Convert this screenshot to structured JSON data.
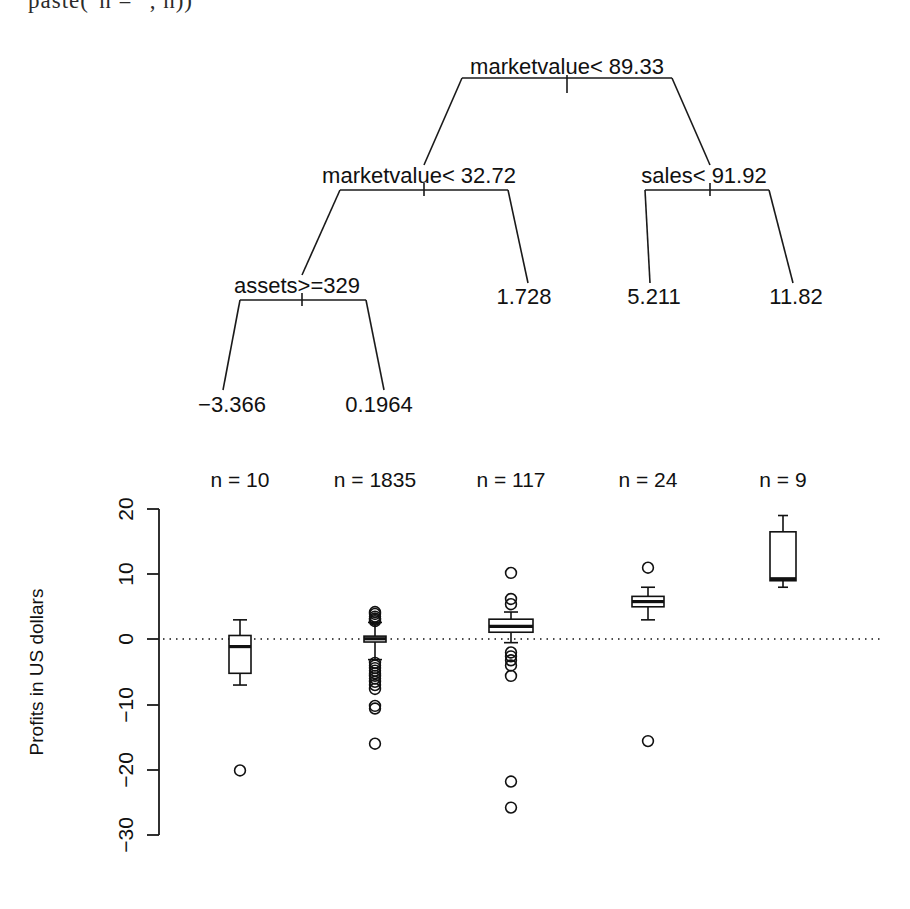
{
  "code_fragment": "paste(\"n = \", n))",
  "tree": {
    "nodes": [
      {
        "id": "root",
        "label": "marketvalue< 89.33",
        "x": 567,
        "y": 66
      },
      {
        "id": "n2",
        "label": "marketvalue< 32.72",
        "x": 419,
        "y": 175
      },
      {
        "id": "n3",
        "label": "sales< 91.92",
        "x": 704,
        "y": 175
      },
      {
        "id": "n4",
        "label": "assets>=329",
        "x": 297,
        "y": 285
      }
    ],
    "leaves": [
      {
        "id": "l1",
        "label": "−3.366",
        "x": 232,
        "y": 404
      },
      {
        "id": "l2",
        "label": "0.1964",
        "x": 379,
        "y": 404
      },
      {
        "id": "l3",
        "label": "1.728",
        "x": 524,
        "y": 296
      },
      {
        "id": "l4",
        "label": "5.211",
        "x": 654,
        "y": 296
      },
      {
        "id": "l5",
        "label": "11.82",
        "x": 796,
        "y": 296
      }
    ]
  },
  "boxplot": {
    "ylabel": "Profits in US dollars",
    "y_ticks": [
      20,
      10,
      0,
      -10,
      -20,
      -30
    ],
    "y_tick_labels": [
      "20",
      "10",
      "0",
      "−10",
      "−20",
      "−30"
    ],
    "ylim": [
      -30,
      20
    ],
    "zero_reference_line": 0,
    "group_labels": [
      "n =  10",
      "n =  1835",
      "n =  117",
      "n =  24",
      "n =  9"
    ],
    "group_counts": [
      10,
      1835,
      117,
      24,
      9
    ]
  },
  "chart_data": {
    "type": "box",
    "title": "",
    "xlabel": "",
    "ylabel": "Profits in US dollars",
    "ylim": [
      -30,
      20
    ],
    "grid": false,
    "legend": "none",
    "categories": [
      "n =  10",
      "n =  1835",
      "n =  117",
      "n =  24",
      "n =  9"
    ],
    "reference_line": {
      "y": 0,
      "style": "dotted"
    },
    "series": [
      {
        "name": "n =  10",
        "n": 10,
        "whisker_low": -7.0,
        "q1": -5.2,
        "median": -1.1,
        "q3": 0.6,
        "whisker_high": 3.0,
        "outliers": [
          -20.1
        ]
      },
      {
        "name": "n =  1835",
        "n": 1835,
        "whisker_low": -3.1,
        "q1": -0.4,
        "median": 0.1,
        "q3": 0.5,
        "whisker_high": 2.6,
        "outliers": [
          4.2,
          3.9,
          3.5,
          3.2,
          3.0,
          2.8,
          -3.6,
          -4.0,
          -4.4,
          -4.8,
          -5.2,
          -5.6,
          -6.0,
          -6.5,
          -7.0,
          -7.6,
          -10.2,
          -10.6,
          -16.0
        ]
      },
      {
        "name": "n =  117",
        "n": 117,
        "whisker_low": -0.5,
        "q1": 1.1,
        "median": 2.0,
        "q3": 3.1,
        "whisker_high": 4.2,
        "outliers": [
          10.2,
          6.2,
          5.4,
          -2.0,
          -2.6,
          -3.2,
          -4.0,
          -5.6,
          -21.8,
          -25.8
        ]
      },
      {
        "name": "n =  24",
        "n": 24,
        "whisker_low": 3.0,
        "q1": 5.0,
        "median": 5.8,
        "q3": 6.6,
        "whisker_high": 8.0,
        "outliers": [
          11.0,
          -15.6
        ]
      },
      {
        "name": "n =  9",
        "n": 9,
        "whisker_low": 8.0,
        "q1": 9.0,
        "median": 9.3,
        "q3": 16.5,
        "whisker_high": 19.0,
        "outliers": []
      }
    ]
  }
}
